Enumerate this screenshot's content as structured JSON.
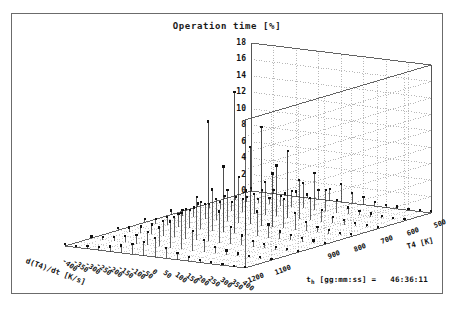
{
  "window": {
    "background": "#ffffff",
    "border_color": "#6b6b6b"
  },
  "status": {
    "label_main": "t",
    "label_sub": "h",
    "label_units": " [gg:mm:ss] =",
    "value": "46:36:11"
  },
  "chart_data": {
    "type": "bar",
    "render": "3d-impulse-stem",
    "title": "Operation time [%]",
    "xlabel": "d(T4)/dt [K/s]",
    "ylabel": "T4 [K]",
    "zlabel": "",
    "grid": true,
    "legend": "none",
    "projection": "isometric-3d",
    "zlim": [
      0,
      18
    ],
    "zticks": [
      0,
      2,
      4,
      6,
      8,
      10,
      12,
      14,
      16,
      18
    ],
    "xlim": [
      -400,
      400
    ],
    "xticks": [
      -400,
      -350,
      -300,
      -250,
      -200,
      -150,
      -100,
      -50,
      0,
      50,
      100,
      150,
      200,
      250,
      300,
      350,
      400
    ],
    "ylim": [
      500,
      1200
    ],
    "yticks": [
      500,
      600,
      700,
      800,
      900,
      1000,
      1100,
      1200
    ],
    "ytick_labels_visible": [
      500,
      600,
      700,
      800,
      900,
      1100,
      1200
    ],
    "marker": "filled-square",
    "marker_color": "#111111",
    "stem_color": "#222222",
    "wall_grid_color": "#9a9a9a",
    "floor_grid_color": "#b0b0b0",
    "points": [
      {
        "x": -400,
        "y": 500,
        "z": 0.4
      },
      {
        "x": -350,
        "y": 500,
        "z": 0.3
      },
      {
        "x": -300,
        "y": 500,
        "z": 0.5
      },
      {
        "x": -250,
        "y": 500,
        "z": 0.2
      },
      {
        "x": -200,
        "y": 500,
        "z": 0.6
      },
      {
        "x": -150,
        "y": 500,
        "z": 0.4
      },
      {
        "x": -100,
        "y": 500,
        "z": 1.1
      },
      {
        "x": -50,
        "y": 500,
        "z": 1.4
      },
      {
        "x": 0,
        "y": 500,
        "z": 2.2
      },
      {
        "x": 50,
        "y": 500,
        "z": 1.3
      },
      {
        "x": 100,
        "y": 500,
        "z": 0.9
      },
      {
        "x": 150,
        "y": 500,
        "z": 0.5
      },
      {
        "x": 200,
        "y": 500,
        "z": 0.3
      },
      {
        "x": 250,
        "y": 500,
        "z": 0.3
      },
      {
        "x": 300,
        "y": 500,
        "z": 0.2
      },
      {
        "x": 350,
        "y": 500,
        "z": 0.2
      },
      {
        "x": 400,
        "y": 500,
        "z": 0.2
      },
      {
        "x": -400,
        "y": 600,
        "z": 0.3
      },
      {
        "x": -350,
        "y": 600,
        "z": 0.4
      },
      {
        "x": -300,
        "y": 600,
        "z": 0.6
      },
      {
        "x": -250,
        "y": 600,
        "z": 0.5
      },
      {
        "x": -200,
        "y": 600,
        "z": 0.8
      },
      {
        "x": -150,
        "y": 600,
        "z": 1.2
      },
      {
        "x": -100,
        "y": 600,
        "z": 2.0
      },
      {
        "x": -50,
        "y": 600,
        "z": 3.1
      },
      {
        "x": 0,
        "y": 600,
        "z": 4.5
      },
      {
        "x": 50,
        "y": 600,
        "z": 2.6
      },
      {
        "x": 100,
        "y": 600,
        "z": 1.5
      },
      {
        "x": 150,
        "y": 600,
        "z": 0.8
      },
      {
        "x": 200,
        "y": 600,
        "z": 0.5
      },
      {
        "x": 250,
        "y": 600,
        "z": 0.4
      },
      {
        "x": 300,
        "y": 600,
        "z": 0.3
      },
      {
        "x": 350,
        "y": 600,
        "z": 0.2
      },
      {
        "x": 400,
        "y": 600,
        "z": 0.2
      },
      {
        "x": -400,
        "y": 700,
        "z": 0.4
      },
      {
        "x": -350,
        "y": 700,
        "z": 0.5
      },
      {
        "x": -300,
        "y": 700,
        "z": 0.9
      },
      {
        "x": -250,
        "y": 700,
        "z": 1.1
      },
      {
        "x": -200,
        "y": 700,
        "z": 1.6
      },
      {
        "x": -150,
        "y": 700,
        "z": 2.4
      },
      {
        "x": -100,
        "y": 700,
        "z": 4.0
      },
      {
        "x": -50,
        "y": 700,
        "z": 6.2
      },
      {
        "x": 0,
        "y": 700,
        "z": 8.1
      },
      {
        "x": 50,
        "y": 700,
        "z": 4.8
      },
      {
        "x": 100,
        "y": 700,
        "z": 2.7
      },
      {
        "x": 150,
        "y": 700,
        "z": 1.4
      },
      {
        "x": 200,
        "y": 700,
        "z": 0.8
      },
      {
        "x": 250,
        "y": 700,
        "z": 0.6
      },
      {
        "x": 300,
        "y": 700,
        "z": 0.4
      },
      {
        "x": 350,
        "y": 700,
        "z": 0.3
      },
      {
        "x": 400,
        "y": 700,
        "z": 0.2
      },
      {
        "x": -400,
        "y": 800,
        "z": 0.5
      },
      {
        "x": -350,
        "y": 800,
        "z": 0.7
      },
      {
        "x": -300,
        "y": 800,
        "z": 1.2
      },
      {
        "x": -250,
        "y": 800,
        "z": 1.8
      },
      {
        "x": -200,
        "y": 800,
        "z": 2.6
      },
      {
        "x": -150,
        "y": 800,
        "z": 3.8
      },
      {
        "x": -100,
        "y": 800,
        "z": 5.6
      },
      {
        "x": -50,
        "y": 800,
        "z": 9.4
      },
      {
        "x": 0,
        "y": 800,
        "z": 12.0
      },
      {
        "x": 50,
        "y": 800,
        "z": 6.5
      },
      {
        "x": 100,
        "y": 800,
        "z": 3.6
      },
      {
        "x": 150,
        "y": 800,
        "z": 2.0
      },
      {
        "x": 200,
        "y": 800,
        "z": 1.1
      },
      {
        "x": 250,
        "y": 800,
        "z": 0.7
      },
      {
        "x": 300,
        "y": 800,
        "z": 0.5
      },
      {
        "x": 350,
        "y": 800,
        "z": 0.3
      },
      {
        "x": 400,
        "y": 800,
        "z": 0.3
      },
      {
        "x": -400,
        "y": 900,
        "z": 0.4
      },
      {
        "x": -350,
        "y": 900,
        "z": 0.6
      },
      {
        "x": -300,
        "y": 900,
        "z": 1.0
      },
      {
        "x": -250,
        "y": 900,
        "z": 1.5
      },
      {
        "x": -200,
        "y": 900,
        "z": 2.2
      },
      {
        "x": -150,
        "y": 900,
        "z": 3.3
      },
      {
        "x": -100,
        "y": 900,
        "z": 5.0
      },
      {
        "x": -50,
        "y": 900,
        "z": 8.0
      },
      {
        "x": 0,
        "y": 900,
        "z": 17.2
      },
      {
        "x": 50,
        "y": 900,
        "z": 5.4
      },
      {
        "x": 100,
        "y": 900,
        "z": 3.0
      },
      {
        "x": 150,
        "y": 900,
        "z": 1.6
      },
      {
        "x": 200,
        "y": 900,
        "z": 0.9
      },
      {
        "x": 250,
        "y": 900,
        "z": 0.6
      },
      {
        "x": 300,
        "y": 900,
        "z": 0.4
      },
      {
        "x": 350,
        "y": 900,
        "z": 0.3
      },
      {
        "x": 400,
        "y": 900,
        "z": 0.2
      },
      {
        "x": -400,
        "y": 1000,
        "z": 0.3
      },
      {
        "x": -350,
        "y": 1000,
        "z": 0.5
      },
      {
        "x": -300,
        "y": 1000,
        "z": 0.8
      },
      {
        "x": -250,
        "y": 1000,
        "z": 1.2
      },
      {
        "x": -200,
        "y": 1000,
        "z": 1.8
      },
      {
        "x": -150,
        "y": 1000,
        "z": 2.5
      },
      {
        "x": -100,
        "y": 1000,
        "z": 3.6
      },
      {
        "x": -50,
        "y": 1000,
        "z": 5.2
      },
      {
        "x": 0,
        "y": 1000,
        "z": 14.6
      },
      {
        "x": 50,
        "y": 1000,
        "z": 3.8
      },
      {
        "x": 100,
        "y": 1000,
        "z": 2.1
      },
      {
        "x": 150,
        "y": 1000,
        "z": 1.2
      },
      {
        "x": 200,
        "y": 1000,
        "z": 0.7
      },
      {
        "x": 250,
        "y": 1000,
        "z": 0.5
      },
      {
        "x": 300,
        "y": 1000,
        "z": 0.3
      },
      {
        "x": 350,
        "y": 1000,
        "z": 0.2
      },
      {
        "x": 400,
        "y": 1000,
        "z": 0.2
      },
      {
        "x": -400,
        "y": 1100,
        "z": 0.2
      },
      {
        "x": -350,
        "y": 1100,
        "z": 0.3
      },
      {
        "x": -300,
        "y": 1100,
        "z": 0.5
      },
      {
        "x": -250,
        "y": 1100,
        "z": 0.8
      },
      {
        "x": -200,
        "y": 1100,
        "z": 1.1
      },
      {
        "x": -150,
        "y": 1100,
        "z": 1.6
      },
      {
        "x": -100,
        "y": 1100,
        "z": 2.3
      },
      {
        "x": -50,
        "y": 1100,
        "z": 3.2
      },
      {
        "x": 0,
        "y": 1100,
        "z": 4.4
      },
      {
        "x": 50,
        "y": 1100,
        "z": 2.4
      },
      {
        "x": 100,
        "y": 1100,
        "z": 1.4
      },
      {
        "x": 150,
        "y": 1100,
        "z": 0.8
      },
      {
        "x": 200,
        "y": 1100,
        "z": 0.5
      },
      {
        "x": 250,
        "y": 1100,
        "z": 0.3
      },
      {
        "x": 300,
        "y": 1100,
        "z": 0.2
      },
      {
        "x": 350,
        "y": 1100,
        "z": 0.2
      },
      {
        "x": 400,
        "y": 1100,
        "z": 0.1
      },
      {
        "x": -400,
        "y": 1200,
        "z": 0.2
      },
      {
        "x": -350,
        "y": 1200,
        "z": 0.2
      },
      {
        "x": -300,
        "y": 1200,
        "z": 0.3
      },
      {
        "x": -250,
        "y": 1200,
        "z": 0.4
      },
      {
        "x": -200,
        "y": 1200,
        "z": 0.6
      },
      {
        "x": -150,
        "y": 1200,
        "z": 0.9
      },
      {
        "x": -100,
        "y": 1200,
        "z": 1.2
      },
      {
        "x": -50,
        "y": 1200,
        "z": 1.7
      },
      {
        "x": 0,
        "y": 1200,
        "z": 2.3
      },
      {
        "x": 50,
        "y": 1200,
        "z": 1.3
      },
      {
        "x": 100,
        "y": 1200,
        "z": 0.8
      },
      {
        "x": 150,
        "y": 1200,
        "z": 0.5
      },
      {
        "x": 200,
        "y": 1200,
        "z": 0.3
      },
      {
        "x": 250,
        "y": 1200,
        "z": 0.2
      },
      {
        "x": 300,
        "y": 1200,
        "z": 0.2
      },
      {
        "x": 350,
        "y": 1200,
        "z": 0.1
      },
      {
        "x": 400,
        "y": 1200,
        "z": 0.1
      }
    ]
  }
}
